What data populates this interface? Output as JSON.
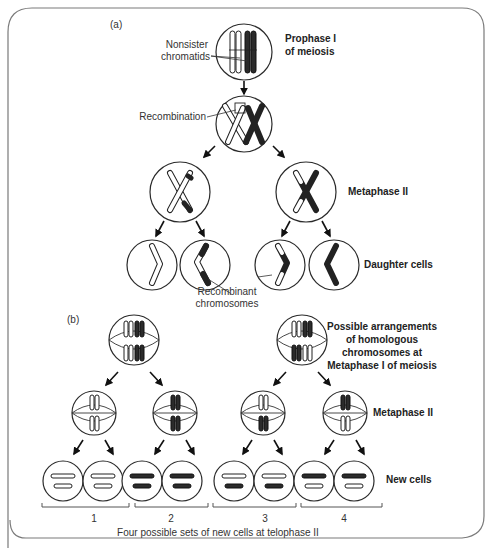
{
  "panel_a": {
    "label": "(a)",
    "stages": {
      "prophase_line1": "Prophase I",
      "prophase_line2": "of meiosis",
      "metaphase": "Metaphase II",
      "daughter": "Daughter cells"
    },
    "annotations": {
      "nonsister_line1": "Nonsister",
      "nonsister_line2": "chromatids",
      "recombination": "Recombination",
      "recombinant_line1": "Recombinant",
      "recombinant_line2": "chromosomes"
    }
  },
  "panel_b": {
    "label": "(b)",
    "stages": {
      "arrangements_line1": "Possible arrangements",
      "arrangements_line2": "of homologous",
      "arrangements_line3": "chromosomes at",
      "arrangements_line4": "Metaphase I of meiosis",
      "metaphase": "Metaphase II",
      "new_cells": "New cells"
    },
    "sets": [
      "1",
      "2",
      "3",
      "4"
    ],
    "caption": "Four possible sets of new cells at telophase II"
  },
  "colors": {
    "ink": "#222222",
    "frame": "#7a7a7a",
    "background": "#ffffff"
  }
}
